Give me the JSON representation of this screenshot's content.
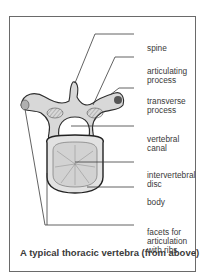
{
  "figure": {
    "caption": "A typical thoracic vertebra (from above)",
    "labels": [
      {
        "id": "spine",
        "text": "spine"
      },
      {
        "id": "articulating-process",
        "text": "articulating\nprocess"
      },
      {
        "id": "transverse-process",
        "text": "transverse\nprocess"
      },
      {
        "id": "vertebral-canal",
        "text": "vertebral\ncanal"
      },
      {
        "id": "intervertebral-disc",
        "text": "intervertebral\ndisc"
      },
      {
        "id": "body",
        "text": "body"
      },
      {
        "id": "facets",
        "text": "facets for\narticulation\nwith ribs"
      }
    ]
  }
}
